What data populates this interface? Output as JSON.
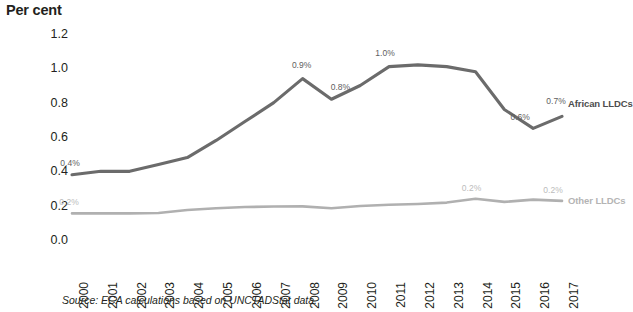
{
  "title_fragment": "",
  "axis_title": "Per cent",
  "source_note": "Source: ECA calculations based on UNCTADStat data.",
  "series_labels": {
    "african": "African LLDCs",
    "other": "Other LLDCs"
  },
  "chart_data": {
    "type": "line",
    "title": "",
    "xlabel": "",
    "ylabel": "Per cent",
    "ylim": [
      0.0,
      1.2
    ],
    "yticks": [
      "0.0",
      "0.2",
      "0.4",
      "0.6",
      "0.8",
      "1.0",
      "1.2"
    ],
    "ytick_values": [
      0.0,
      0.2,
      0.4,
      0.6,
      0.8,
      1.0,
      1.2
    ],
    "grid": false,
    "legend_position": "right-inline-end-of-line",
    "categories": [
      "2000",
      "2001",
      "2002",
      "2003",
      "2004",
      "2005",
      "2006",
      "2007",
      "2008",
      "2009",
      "2010",
      "2011",
      "2012",
      "2013",
      "2014",
      "2015",
      "2016",
      "2017"
    ],
    "series": [
      {
        "name": "African LLDCs",
        "color": "#6b6b6b",
        "values": [
          0.38,
          0.4,
          0.4,
          0.44,
          0.48,
          0.58,
          0.69,
          0.8,
          0.94,
          0.82,
          0.9,
          1.01,
          1.02,
          1.01,
          0.98,
          0.76,
          0.65,
          0.72
        ],
        "labels": [
          {
            "category": "2000",
            "text": "0.4%"
          },
          {
            "category": "2008",
            "text": "0.9%"
          },
          {
            "category": "2009",
            "text": "0.8%"
          },
          {
            "category": "2011",
            "text": "1.0%"
          },
          {
            "category": "2016",
            "text": "0.6%"
          },
          {
            "category": "2017",
            "text": "0.7%"
          }
        ]
      },
      {
        "name": "Other LLDCs",
        "color": "#b0b0b0",
        "values": [
          0.155,
          0.155,
          0.155,
          0.157,
          0.175,
          0.185,
          0.192,
          0.195,
          0.196,
          0.185,
          0.198,
          0.205,
          0.21,
          0.218,
          0.24,
          0.222,
          0.235,
          0.228
        ],
        "labels": [
          {
            "category": "2000",
            "text": "0.2%"
          },
          {
            "category": "2014",
            "text": "0.2%"
          },
          {
            "category": "2017",
            "text": "0.2%"
          }
        ]
      }
    ]
  }
}
